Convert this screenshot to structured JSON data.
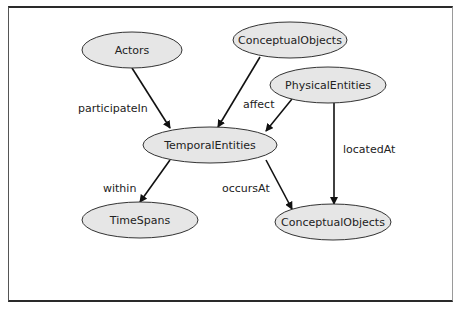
{
  "diagram": {
    "nodes": [
      {
        "id": "actors",
        "label": "Actors",
        "cx": 132,
        "cy": 50,
        "rx": 50,
        "ry": 18
      },
      {
        "id": "conceptual-objects-top",
        "label": "ConceptualObjects",
        "cx": 290,
        "cy": 40,
        "rx": 57,
        "ry": 18
      },
      {
        "id": "physical-entities",
        "label": "PhysicalEntities",
        "cx": 328,
        "cy": 85,
        "rx": 58,
        "ry": 18
      },
      {
        "id": "temporal-entities",
        "label": "TemporalEntities",
        "cx": 210,
        "cy": 145,
        "rx": 67,
        "ry": 18
      },
      {
        "id": "time-spans",
        "label": "TimeSpans",
        "cx": 140,
        "cy": 220,
        "rx": 58,
        "ry": 18
      },
      {
        "id": "conceptual-objects-bottom",
        "label": "ConceptualObjects",
        "cx": 333,
        "cy": 222,
        "rx": 58,
        "ry": 18
      }
    ],
    "edges": [
      {
        "from": "actors",
        "to": "temporal-entities",
        "label": "participateIn",
        "x1": 132,
        "y1": 68,
        "x2": 170,
        "y2": 128,
        "lx": 78,
        "ly": 112
      },
      {
        "from": "conceptual-objects-top",
        "to": "temporal-entities",
        "label": "affect",
        "x1": 260,
        "y1": 57,
        "x2": 218,
        "y2": 127,
        "lx": 243,
        "ly": 108
      },
      {
        "from": "physical-entities",
        "to": "temporal-entities",
        "label": "",
        "x1": 292,
        "y1": 99,
        "x2": 266,
        "y2": 131,
        "lx": 0,
        "ly": 0
      },
      {
        "from": "physical-entities",
        "to": "conceptual-objects-bottom",
        "label": "locatedAt",
        "x1": 334,
        "y1": 103,
        "x2": 334,
        "y2": 204,
        "lx": 343,
        "ly": 153
      },
      {
        "from": "temporal-entities",
        "to": "time-spans",
        "label": "within",
        "x1": 170,
        "y1": 160,
        "x2": 140,
        "y2": 202,
        "lx": 103,
        "ly": 192
      },
      {
        "from": "temporal-entities",
        "to": "conceptual-objects-bottom",
        "label": "occursAt",
        "x1": 266,
        "y1": 160,
        "x2": 292,
        "y2": 209,
        "lx": 222,
        "ly": 192
      }
    ],
    "colors": {
      "node_fill": "#e6e6e6",
      "node_stroke": "#333333",
      "edge": "#111111",
      "text": "#222222"
    }
  }
}
